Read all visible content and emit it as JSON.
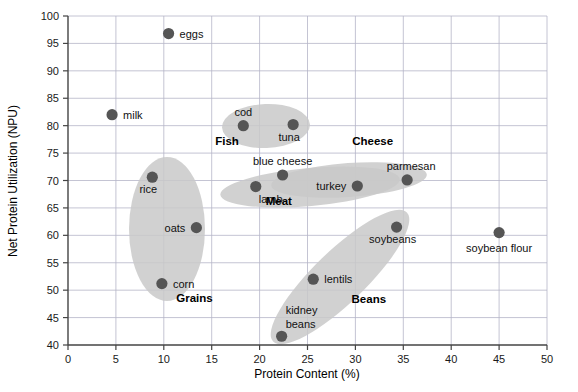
{
  "chart_data": {
    "type": "scatter",
    "title": "",
    "xlabel": "Protein Content (%)",
    "ylabel": "Net Protein Utilization (NPU)",
    "xlim": [
      0,
      50
    ],
    "ylim": [
      40,
      100
    ],
    "xticks": [
      0,
      5,
      10,
      15,
      20,
      25,
      30,
      35,
      40,
      45,
      50
    ],
    "yticks": [
      40,
      45,
      50,
      55,
      60,
      65,
      70,
      75,
      80,
      85,
      90,
      95,
      100
    ],
    "grid": true,
    "legend": "none",
    "marker_color": "#555555",
    "ellipse_color": "#c8c8c8",
    "grid_color": "#b5b5c8",
    "axis_color": "#555555",
    "points": [
      {
        "label": "eggs",
        "x": 10.5,
        "y": 96.8,
        "label_pos": "right"
      },
      {
        "label": "milk",
        "x": 4.6,
        "y": 82.0,
        "label_pos": "right"
      },
      {
        "label": "cod",
        "x": 18.3,
        "y": 80.0,
        "label_pos": "above"
      },
      {
        "label": "tuna",
        "x": 23.5,
        "y": 80.2,
        "label_pos": "below-left"
      },
      {
        "label": "rice",
        "x": 8.8,
        "y": 70.6,
        "label_pos": "below-left"
      },
      {
        "label": "blue cheese",
        "x": 22.4,
        "y": 71.0,
        "label_pos": "above"
      },
      {
        "label": "parmesan",
        "x": 35.4,
        "y": 70.1,
        "label_pos": "above-left"
      },
      {
        "label": "lamb",
        "x": 19.6,
        "y": 68.9,
        "label_pos": "below-right"
      },
      {
        "label": "turkey",
        "x": 30.2,
        "y": 69.0,
        "label_pos": "left"
      },
      {
        "label": "oats",
        "x": 13.4,
        "y": 61.4,
        "label_pos": "left"
      },
      {
        "label": "soybeans",
        "x": 34.3,
        "y": 61.5,
        "label_pos": "below-left"
      },
      {
        "label": "soybean flour",
        "x": 45.0,
        "y": 60.5,
        "label_pos": "below"
      },
      {
        "label": "lentils",
        "x": 25.6,
        "y": 52.0,
        "label_pos": "right"
      },
      {
        "label": "corn",
        "x": 9.8,
        "y": 51.2,
        "label_pos": "right"
      },
      {
        "label": "kidney beans",
        "x": 22.3,
        "y": 41.6,
        "label_pos": "above-right"
      }
    ],
    "groups": [
      {
        "name": "Fish",
        "label_x": 16.6,
        "label_y": 76.4
      },
      {
        "name": "Cheese",
        "label_x": 31.8,
        "label_y": 76.4
      },
      {
        "name": "Meat",
        "label_x": 22.0,
        "label_y": 65.6
      },
      {
        "name": "Grains",
        "label_x": 13.2,
        "label_y": 47.8
      },
      {
        "name": "Beans",
        "label_x": 31.4,
        "label_y": 47.6
      }
    ]
  }
}
